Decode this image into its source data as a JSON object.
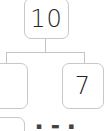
{
  "diagram": {
    "type": "number-bond",
    "whole": "10",
    "parts": [
      "",
      "7"
    ],
    "next_bond_partial_text": "▪ ▬ ▪"
  }
}
